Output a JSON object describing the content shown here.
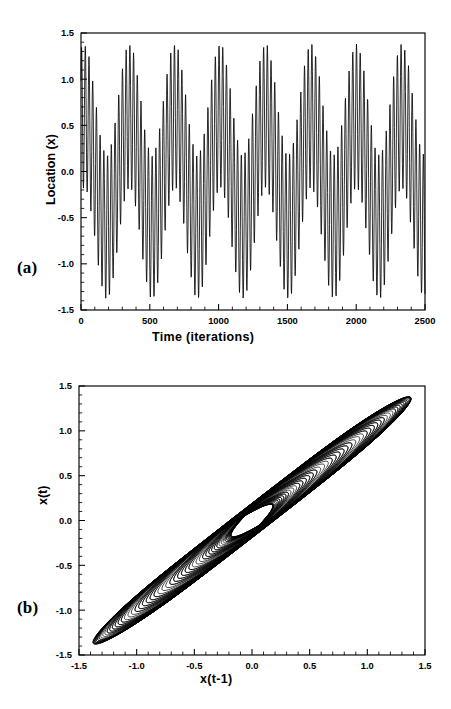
{
  "figure": {
    "panels": [
      {
        "label": "(a)",
        "type": "time-series"
      },
      {
        "label": "(b)",
        "type": "phase-portrait"
      }
    ]
  },
  "chart_data": [
    {
      "type": "line",
      "panel_label": "(a)",
      "title": "",
      "xlabel": "Time  (iterations)",
      "ylabel": "Location (x)",
      "xlim": [
        0,
        2500
      ],
      "ylim": [
        -1.5,
        1.5
      ],
      "xticks": [
        0,
        500,
        1000,
        1500,
        2000,
        2500
      ],
      "xticklabels": [
        "0",
        "500",
        "1000",
        "1500",
        "2000",
        "2500"
      ],
      "yticks": [
        -1.5,
        -1.0,
        -0.5,
        0.0,
        0.5,
        1.0,
        1.5
      ],
      "yticklabels": [
        "-1.5",
        "-1.0",
        "-0.5",
        "0.0",
        "0.5",
        "1.0",
        "1.5"
      ],
      "minor_ticks_x": 100,
      "minor_ticks_y": 0.1,
      "grid": false,
      "legend": "none",
      "description": "Quasi-periodic time series: fast oscillation modulated by a slower incommensurate envelope, amplitude bounded near +/-1.4",
      "model": {
        "form": "x(t) = A1*sin(w1*t + p1) + A2*sin(w2*t + p2)",
        "A1": 0.78,
        "w1_period": 27.0,
        "p1": 0.6,
        "A2": 0.6,
        "w2_period": 330.0,
        "p2": 1.15,
        "samples": 2500
      }
    },
    {
      "type": "scatter",
      "panel_label": "(b)",
      "title": "",
      "xlabel": "x(t-1)",
      "ylabel": "x(t)",
      "xlim": [
        -1.5,
        1.5
      ],
      "ylim": [
        -1.5,
        1.5
      ],
      "xticks": [
        -1.5,
        -1.0,
        -0.5,
        0.0,
        0.5,
        1.0,
        1.5
      ],
      "xticklabels": [
        "-1.5",
        "-1.0",
        "-0.5",
        "0.0",
        "0.5",
        "1.0",
        "1.5"
      ],
      "yticks": [
        -1.5,
        -1.0,
        -0.5,
        0.0,
        0.5,
        1.0,
        1.5
      ],
      "yticklabels": [
        "-1.5",
        "-1.0",
        "-0.5",
        "0.0",
        "0.5",
        "1.0",
        "1.5"
      ],
      "minor_ticks_x": 0.1,
      "minor_ticks_y": 0.1,
      "grid": false,
      "legend": "none",
      "description": "Delay-coordinate embedding of the quasi-periodic series forms a torus (closed annulus) tilted along the main diagonal, with the trajectory winding in small loops around the tube",
      "model": {
        "form": "delay embedding of x(t) vs x(t-1) of the two-frequency series",
        "samples": 2500,
        "outer_radius": 1.4,
        "inner_radius": 0.45,
        "tilt_deg": 45
      }
    }
  ]
}
